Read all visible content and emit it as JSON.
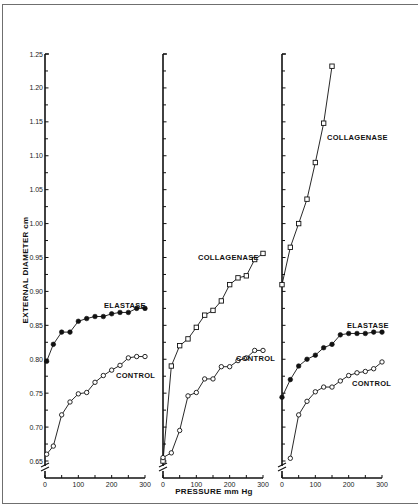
{
  "chart_data": {
    "type": "line",
    "title": "",
    "xlabel": "PRESSURE mm Hg",
    "ylabel": "EXTERNAL DIAMETER cm",
    "ylim": [
      0.63,
      1.25
    ],
    "xlim": [
      0,
      300
    ],
    "y_ticks": [
      "0.65",
      "0.70",
      "0.75",
      "0.80",
      "0.85",
      "0.90",
      "0.95",
      "1.00",
      "1.05",
      "1.10",
      "1.15",
      "1.20",
      "1.25"
    ],
    "x_ticks": [
      "0",
      "100",
      "200",
      "300"
    ],
    "grid": false,
    "legend_position": "inline labels",
    "panels": [
      {
        "series": [
          {
            "name": "ELASTASE",
            "marker": "filled-circle",
            "x": [
              5,
              25,
              50,
              75,
              100,
              125,
              150,
              175,
              200,
              225,
              250,
              275,
              300
            ],
            "values": [
              0.797,
              0.822,
              0.84,
              0.84,
              0.856,
              0.86,
              0.863,
              0.863,
              0.867,
              0.869,
              0.869,
              0.875,
              0.875
            ]
          },
          {
            "name": "CONTROL",
            "marker": "open-circle",
            "x": [
              5,
              25,
              50,
              75,
              100,
              125,
              150,
              175,
              200,
              225,
              250,
              275,
              300
            ],
            "values": [
              0.66,
              0.672,
              0.718,
              0.737,
              0.749,
              0.751,
              0.766,
              0.776,
              0.784,
              0.791,
              0.802,
              0.804,
              0.804
            ]
          }
        ]
      },
      {
        "series": [
          {
            "name": "COLLAGENASE",
            "marker": "open-square",
            "x": [
              0,
              25,
              50,
              75,
              100,
              125,
              150,
              175,
              200,
              225,
              250,
              275,
              300
            ],
            "values": [
              0.65,
              0.79,
              0.82,
              0.83,
              0.847,
              0.865,
              0.872,
              0.886,
              0.91,
              0.92,
              0.923,
              0.947,
              0.956
            ]
          },
          {
            "name": "CONTROL",
            "marker": "open-circle",
            "x": [
              0,
              25,
              50,
              75,
              100,
              125,
              150,
              175,
              200,
              225,
              250,
              275,
              300
            ],
            "values": [
              0.655,
              0.662,
              0.695,
              0.746,
              0.751,
              0.771,
              0.771,
              0.789,
              0.789,
              0.798,
              0.802,
              0.813,
              0.813
            ]
          }
        ]
      },
      {
        "series": [
          {
            "name": "COLLAGENASE",
            "marker": "open-square",
            "x": [
              0,
              25,
              50,
              75,
              100,
              125,
              150
            ],
            "values": [
              0.91,
              0.965,
              1.0,
              1.036,
              1.09,
              1.148,
              1.232
            ]
          },
          {
            "name": "ELASTASE",
            "marker": "filled-circle",
            "x": [
              0,
              25,
              50,
              75,
              100,
              125,
              150,
              175,
              200,
              225,
              250,
              275,
              300
            ],
            "values": [
              0.744,
              0.77,
              0.79,
              0.8,
              0.806,
              0.817,
              0.822,
              0.836,
              0.838,
              0.838,
              0.838,
              0.84,
              0.84
            ]
          },
          {
            "name": "CONTROL",
            "marker": "open-circle",
            "x": [
              25,
              50,
              75,
              100,
              125,
              150,
              175,
              200,
              225,
              250,
              275,
              300
            ],
            "values": [
              0.654,
              0.718,
              0.738,
              0.752,
              0.759,
              0.759,
              0.768,
              0.776,
              0.78,
              0.782,
              0.786,
              0.796
            ]
          }
        ]
      }
    ]
  },
  "labels": {
    "ylabel": "EXTERNAL DIAMETER cm",
    "xlabel": "PRESSURE mm Hg",
    "panel1": {
      "elastase": "ELASTASE",
      "control": "CONTROL"
    },
    "panel2": {
      "collagenase": "COLLAGENASE",
      "control": "CONTROL"
    },
    "panel3": {
      "collagenase": "COLLAGENASE",
      "elastase": "ELASTASE",
      "control": "CONTROL"
    }
  },
  "colors": {
    "ink": "#111111",
    "frame": "#6f6f6f",
    "background": "#ffffff"
  }
}
